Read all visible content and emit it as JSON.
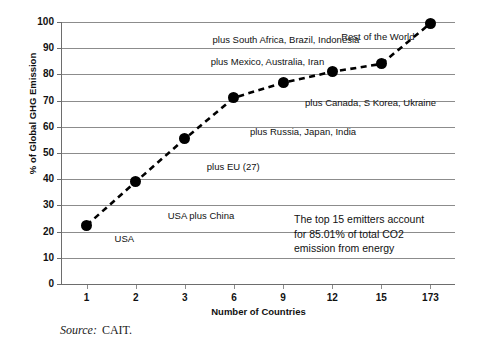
{
  "chart_data": {
    "type": "line",
    "title": "",
    "subtitle": "",
    "xlabel": "Number of Countries",
    "ylabel": "% of Global GHG Emission",
    "categories": [
      "1",
      "2",
      "3",
      "6",
      "9",
      "12",
      "15",
      "173"
    ],
    "values": [
      22.4,
      39.0,
      55.4,
      71.1,
      76.8,
      81.0,
      84.0,
      99.5
    ],
    "ylim": [
      0,
      100
    ],
    "yticks": [
      "0",
      "10",
      "20",
      "30",
      "40",
      "50",
      "60",
      "70",
      "80",
      "90",
      "100"
    ],
    "grid": true,
    "legend": "none",
    "series_style": "dashed-line-with-filled-circle-markers",
    "marker_color": "#000000",
    "line_color": "#000000",
    "grid_color": "#8c8c8c",
    "annotations": [
      {
        "text": "USA",
        "category": "1"
      },
      {
        "text": "USA plus China",
        "category": "2"
      },
      {
        "text": "plus EU (27)",
        "category": "3"
      },
      {
        "text": "plus Russia, Japan, India",
        "category": "6"
      },
      {
        "text": "plus Canada, S Korea, Ukraine",
        "category": "9"
      },
      {
        "text": "plus Mexico, Australia, Iran",
        "category": "12"
      },
      {
        "text": "plus South Africa, Brazil, Indonesia",
        "category": "15"
      },
      {
        "text": "Rest of the World",
        "category": "173"
      }
    ],
    "callout": {
      "line1": "The top 15 emitters account",
      "line2": "for 85.01% of total CO2",
      "line3": "emission from energy"
    }
  },
  "source": {
    "label": "Source:",
    "value": "CAIT."
  }
}
